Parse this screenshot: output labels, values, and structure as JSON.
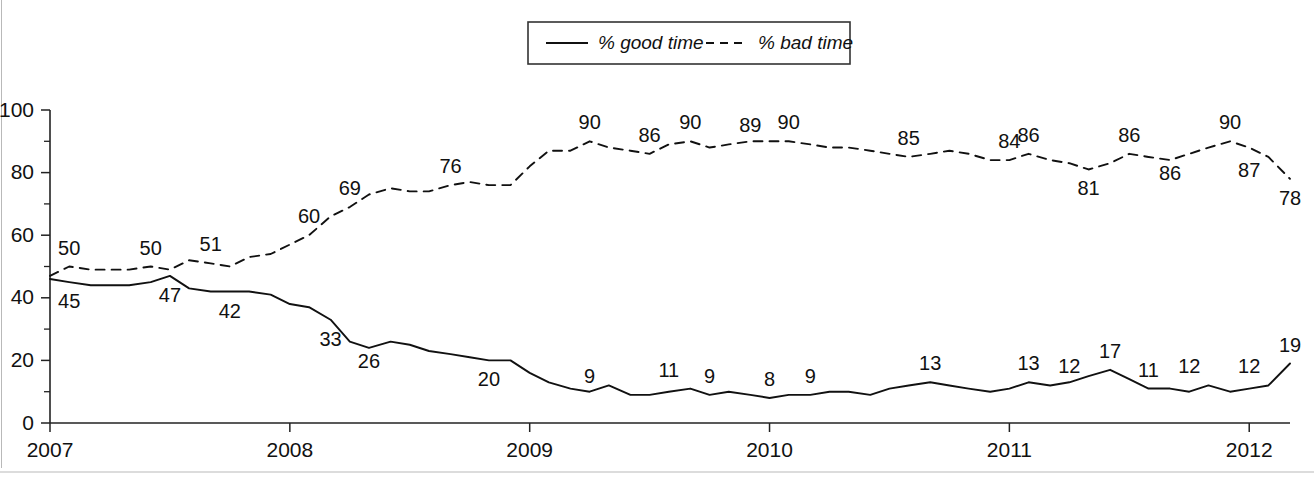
{
  "chart_data": {
    "type": "line",
    "title": "",
    "subtitle": "",
    "xlabel": "",
    "ylabel": "",
    "xlim": [
      2007.0,
      2012.17
    ],
    "ylim": [
      0,
      100
    ],
    "grid": false,
    "legend_position": "top-center",
    "y_ticks": [
      "0",
      "20",
      "40",
      "60",
      "80",
      "100"
    ],
    "y_tick_values": [
      0,
      20,
      40,
      60,
      80,
      100
    ],
    "y_minor_tick_values": [
      10,
      30,
      50,
      70,
      90
    ],
    "x_ticks": [
      "2007",
      "2008",
      "2009",
      "2010",
      "2011",
      "2012"
    ],
    "x_tick_values": [
      2007,
      2008,
      2009,
      2010,
      2011,
      2012
    ],
    "series": [
      {
        "name": "% good time",
        "style": "solid",
        "color": "#111111",
        "x": [
          2007.0,
          2007.08,
          2007.17,
          2007.25,
          2007.33,
          2007.42,
          2007.5,
          2007.58,
          2007.67,
          2007.75,
          2007.83,
          2007.92,
          2008.0,
          2008.08,
          2008.17,
          2008.25,
          2008.33,
          2008.42,
          2008.5,
          2008.58,
          2008.67,
          2008.75,
          2008.83,
          2008.92,
          2009.0,
          2009.08,
          2009.17,
          2009.25,
          2009.33,
          2009.42,
          2009.5,
          2009.58,
          2009.67,
          2009.75,
          2009.83,
          2009.92,
          2010.0,
          2010.08,
          2010.17,
          2010.25,
          2010.33,
          2010.42,
          2010.5,
          2010.58,
          2010.67,
          2010.75,
          2010.83,
          2010.92,
          2011.0,
          2011.08,
          2011.17,
          2011.25,
          2011.33,
          2011.42,
          2011.5,
          2011.58,
          2011.67,
          2011.75,
          2011.83,
          2011.92,
          2012.0,
          2012.08,
          2012.17
        ],
        "values": [
          46,
          45,
          44,
          44,
          44,
          45,
          47,
          43,
          42,
          42,
          42,
          41,
          38,
          37,
          33,
          26,
          24,
          26,
          25,
          23,
          22,
          21,
          20,
          20,
          16,
          13,
          11,
          10,
          12,
          9,
          9,
          10,
          11,
          9,
          10,
          9,
          8,
          9,
          9,
          10,
          10,
          9,
          11,
          12,
          13,
          12,
          11,
          10,
          11,
          13,
          12,
          13,
          15,
          17,
          14,
          11,
          11,
          10,
          12,
          10,
          11,
          12,
          19
        ]
      },
      {
        "name": "% bad time",
        "style": "dashed",
        "color": "#111111",
        "x": [
          2007.0,
          2007.08,
          2007.17,
          2007.25,
          2007.33,
          2007.42,
          2007.5,
          2007.58,
          2007.67,
          2007.75,
          2007.83,
          2007.92,
          2008.0,
          2008.08,
          2008.17,
          2008.25,
          2008.33,
          2008.42,
          2008.5,
          2008.58,
          2008.67,
          2008.75,
          2008.83,
          2008.92,
          2009.0,
          2009.08,
          2009.17,
          2009.25,
          2009.33,
          2009.42,
          2009.5,
          2009.58,
          2009.67,
          2009.75,
          2009.83,
          2009.92,
          2010.0,
          2010.08,
          2010.17,
          2010.25,
          2010.33,
          2010.42,
          2010.5,
          2010.58,
          2010.67,
          2010.75,
          2010.83,
          2010.92,
          2011.0,
          2011.08,
          2011.17,
          2011.25,
          2011.33,
          2011.42,
          2011.5,
          2011.58,
          2011.67,
          2011.75,
          2011.83,
          2011.92,
          2012.0,
          2012.08,
          2012.17
        ],
        "values": [
          47,
          50,
          49,
          49,
          49,
          50,
          49,
          52,
          51,
          50,
          53,
          54,
          57,
          60,
          66,
          69,
          73,
          75,
          74,
          74,
          76,
          77,
          76,
          76,
          82,
          87,
          87,
          90,
          88,
          87,
          86,
          89,
          90,
          88,
          89,
          90,
          90,
          90,
          89,
          88,
          88,
          87,
          86,
          85,
          86,
          87,
          86,
          84,
          84,
          86,
          84,
          83,
          81,
          83,
          86,
          85,
          84,
          86,
          88,
          90,
          88,
          85,
          78
        ]
      }
    ],
    "point_labels": [
      {
        "series": "% good time",
        "text": "45",
        "x": 2007.08,
        "value": 45,
        "anchor": "below"
      },
      {
        "series": "% good time",
        "text": "47",
        "x": 2007.5,
        "value": 47,
        "anchor": "below"
      },
      {
        "series": "% good time",
        "text": "42",
        "x": 2007.75,
        "value": 42,
        "anchor": "below"
      },
      {
        "series": "% good time",
        "text": "33",
        "x": 2008.17,
        "value": 33,
        "anchor": "below"
      },
      {
        "series": "% good time",
        "text": "26",
        "x": 2008.33,
        "value": 26,
        "anchor": "below"
      },
      {
        "series": "% good time",
        "text": "20",
        "x": 2008.83,
        "value": 20,
        "anchor": "below"
      },
      {
        "series": "% good time",
        "text": "9",
        "x": 2009.25,
        "value": 9,
        "anchor": "above"
      },
      {
        "series": "% good time",
        "text": "11",
        "x": 2009.58,
        "value": 11,
        "anchor": "above"
      },
      {
        "series": "% good time",
        "text": "9",
        "x": 2009.75,
        "value": 9,
        "anchor": "above"
      },
      {
        "series": "% good time",
        "text": "8",
        "x": 2010.0,
        "value": 8,
        "anchor": "above"
      },
      {
        "series": "% good time",
        "text": "9",
        "x": 2010.17,
        "value": 9,
        "anchor": "above"
      },
      {
        "series": "% good time",
        "text": "13",
        "x": 2010.67,
        "value": 13,
        "anchor": "above"
      },
      {
        "series": "% good time",
        "text": "13",
        "x": 2011.08,
        "value": 13,
        "anchor": "above"
      },
      {
        "series": "% good time",
        "text": "12",
        "x": 2011.25,
        "value": 12,
        "anchor": "above"
      },
      {
        "series": "% good time",
        "text": "17",
        "x": 2011.42,
        "value": 17,
        "anchor": "above"
      },
      {
        "series": "% good time",
        "text": "11",
        "x": 2011.58,
        "value": 11,
        "anchor": "above"
      },
      {
        "series": "% good time",
        "text": "12",
        "x": 2011.75,
        "value": 12,
        "anchor": "above"
      },
      {
        "series": "% good time",
        "text": "12",
        "x": 2012.0,
        "value": 12,
        "anchor": "above"
      },
      {
        "series": "% good time",
        "text": "19",
        "x": 2012.17,
        "value": 19,
        "anchor": "above"
      },
      {
        "series": "% bad time",
        "text": "50",
        "x": 2007.08,
        "value": 50,
        "anchor": "above"
      },
      {
        "series": "% bad time",
        "text": "50",
        "x": 2007.42,
        "value": 50,
        "anchor": "above"
      },
      {
        "series": "% bad time",
        "text": "51",
        "x": 2007.67,
        "value": 51,
        "anchor": "above"
      },
      {
        "series": "% bad time",
        "text": "60",
        "x": 2008.08,
        "value": 60,
        "anchor": "above"
      },
      {
        "series": "% bad time",
        "text": "69",
        "x": 2008.25,
        "value": 69,
        "anchor": "above"
      },
      {
        "series": "% bad time",
        "text": "76",
        "x": 2008.67,
        "value": 76,
        "anchor": "above"
      },
      {
        "series": "% bad time",
        "text": "90",
        "x": 2009.25,
        "value": 90,
        "anchor": "above"
      },
      {
        "series": "% bad time",
        "text": "86",
        "x": 2009.5,
        "value": 86,
        "anchor": "above"
      },
      {
        "series": "% bad time",
        "text": "90",
        "x": 2009.67,
        "value": 90,
        "anchor": "above"
      },
      {
        "series": "% bad time",
        "text": "89",
        "x": 2009.92,
        "value": 89,
        "anchor": "above"
      },
      {
        "series": "% bad time",
        "text": "90",
        "x": 2010.08,
        "value": 90,
        "anchor": "above"
      },
      {
        "series": "% bad time",
        "text": "85",
        "x": 2010.58,
        "value": 85,
        "anchor": "above"
      },
      {
        "series": "% bad time",
        "text": "84",
        "x": 2011.0,
        "value": 84,
        "anchor": "above"
      },
      {
        "series": "% bad time",
        "text": "86",
        "x": 2011.08,
        "value": 86,
        "anchor": "above"
      },
      {
        "series": "% bad time",
        "text": "81",
        "x": 2011.33,
        "value": 81,
        "anchor": "below"
      },
      {
        "series": "% bad time",
        "text": "86",
        "x": 2011.5,
        "value": 86,
        "anchor": "above"
      },
      {
        "series": "% bad time",
        "text": "86",
        "x": 2011.67,
        "value": 86,
        "anchor": "below"
      },
      {
        "series": "% bad time",
        "text": "90",
        "x": 2011.92,
        "value": 90,
        "anchor": "above"
      },
      {
        "series": "% bad time",
        "text": "87",
        "x": 2012.0,
        "value": 87,
        "anchor": "below"
      },
      {
        "series": "% bad time",
        "text": "78",
        "x": 2012.17,
        "value": 78,
        "anchor": "below"
      }
    ]
  },
  "legend": {
    "entries": [
      {
        "label": "% good time",
        "style": "solid"
      },
      {
        "label": "% bad time",
        "style": "dashed"
      }
    ]
  }
}
